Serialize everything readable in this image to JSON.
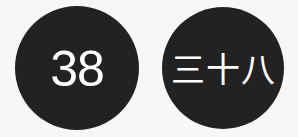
{
  "badges": [
    {
      "label": "38",
      "style": "arabic-numeral"
    },
    {
      "label": "三十八",
      "style": "chinese-numeral"
    }
  ],
  "colors": {
    "background": "#f7f7f5",
    "circle_fill": "#232222",
    "text": "#ffffff"
  }
}
